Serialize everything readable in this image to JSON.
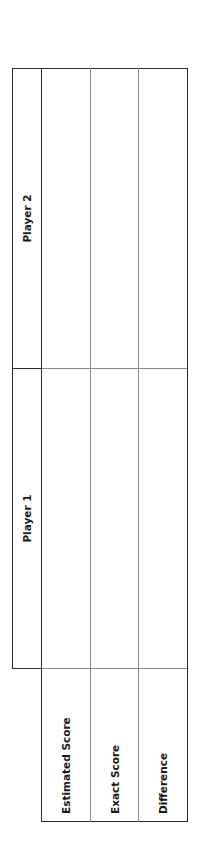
{
  "table": {
    "orientation": "rotated-90-counterclockwise",
    "columns": [
      {
        "label": ""
      },
      {
        "label": "Player 1"
      },
      {
        "label": "Player 2"
      }
    ],
    "rows": [
      {
        "label": "Estimated Score",
        "cells": [
          "",
          ""
        ]
      },
      {
        "label": "Exact Score",
        "cells": [
          "",
          ""
        ]
      },
      {
        "label": "Difference",
        "cells": [
          "",
          ""
        ]
      }
    ]
  },
  "colors": {
    "outer_border": "#2b2b2b",
    "inner_border": "#8a8a8a",
    "text": "#1a1a1a",
    "background": "#ffffff"
  }
}
